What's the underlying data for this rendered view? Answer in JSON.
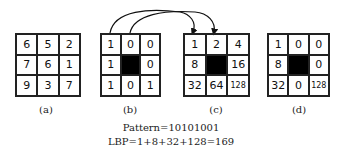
{
  "figure": {
    "panels": [
      {
        "id": "a",
        "caption": "(a)",
        "cells": [
          "6",
          "5",
          "2",
          "7",
          "6",
          "1",
          "9",
          "3",
          "7"
        ],
        "center_filled": false
      },
      {
        "id": "b",
        "caption": "(b)",
        "cells": [
          "1",
          "0",
          "0",
          "1",
          "",
          "0",
          "1",
          "0",
          "1"
        ],
        "center_filled": true
      },
      {
        "id": "c",
        "caption": "(c)",
        "cells": [
          "1",
          "2",
          "4",
          "8",
          "",
          "16",
          "32",
          "64",
          "128"
        ],
        "center_filled": true
      },
      {
        "id": "d",
        "caption": "(d)",
        "cells": [
          "1",
          "0",
          "0",
          "8",
          "",
          "0",
          "32",
          "0",
          "128"
        ],
        "center_filled": true
      }
    ],
    "pattern_label": "Pattern=10101001",
    "lbp_label": "LBP=1+8+32+128=169"
  }
}
